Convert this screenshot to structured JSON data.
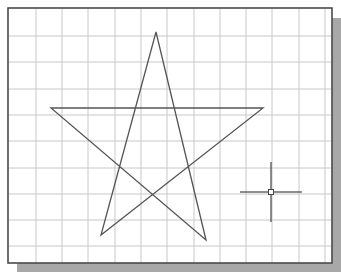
{
  "viewport": {
    "frame": {
      "x": 8,
      "y": 8,
      "width": 324,
      "height": 255
    },
    "shadow_offset": 9,
    "colors": {
      "background": "#ffffff",
      "frame_border": "#4a4a4a",
      "shadow": "#a8a8a8",
      "grid": "#c8c8c8",
      "star": "#555555",
      "cursor": "#444444"
    },
    "grid": {
      "vertical_x": [
        36,
        62,
        88,
        115,
        141,
        167,
        194,
        220,
        246,
        272,
        299,
        325
      ],
      "horizontal_y": [
        36,
        62,
        89,
        115,
        141,
        168,
        194,
        220,
        246
      ]
    },
    "star": {
      "vertices": [
        [
          156,
          32
        ],
        [
          206,
          240
        ],
        [
          51,
          108
        ],
        [
          263,
          108
        ],
        [
          101,
          235
        ]
      ]
    },
    "crosshair": {
      "center": [
        271,
        192
      ],
      "half_width": 31,
      "half_height": 30,
      "pickbox_size": 5
    }
  }
}
